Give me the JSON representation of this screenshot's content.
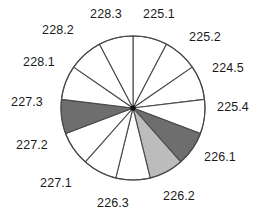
{
  "chart_data": {
    "type": "pie",
    "title": "",
    "subtitle": "",
    "xlabel": "",
    "ylabel": "",
    "legend_position": "none",
    "grid": false,
    "labels_shown": true,
    "start_angle_deg": 0,
    "direction": "clockwise",
    "categories": [
      "225.1",
      "225.2",
      "224.5",
      "225.4",
      "226.1",
      "226.2",
      "226.3",
      "227.1",
      "227.2",
      "227.3",
      "228.1",
      "228.2",
      "228.3"
    ],
    "values": [
      7.7,
      7.7,
      7.7,
      7.7,
      7.7,
      7.7,
      7.7,
      7.7,
      7.7,
      7.7,
      7.7,
      7.7,
      7.7
    ],
    "slices": [
      {
        "label": "225.1",
        "start_deg": 0.0,
        "end_deg": 27.7,
        "fill": "#ffffff",
        "value": 7.7
      },
      {
        "label": "225.2",
        "start_deg": 27.7,
        "end_deg": 55.4,
        "fill": "#ffffff",
        "value": 7.7
      },
      {
        "label": "224.5",
        "start_deg": 55.4,
        "end_deg": 83.1,
        "fill": "#ffffff",
        "value": 7.7
      },
      {
        "label": "225.4",
        "start_deg": 83.1,
        "end_deg": 110.8,
        "fill": "#ffffff",
        "value": 7.7
      },
      {
        "label": "226.1",
        "start_deg": 110.8,
        "end_deg": 138.5,
        "fill": "#6e6e6e",
        "value": 7.7
      },
      {
        "label": "226.2",
        "start_deg": 138.5,
        "end_deg": 166.2,
        "fill": "#bcbcbc",
        "value": 7.7
      },
      {
        "label": "226.3",
        "start_deg": 166.2,
        "end_deg": 193.8,
        "fill": "#ffffff",
        "value": 7.7
      },
      {
        "label": "227.1",
        "start_deg": 193.8,
        "end_deg": 221.5,
        "fill": "#ffffff",
        "value": 7.7
      },
      {
        "label": "227.2",
        "start_deg": 221.5,
        "end_deg": 249.2,
        "fill": "#ffffff",
        "value": 7.7
      },
      {
        "label": "227.3",
        "start_deg": 249.2,
        "end_deg": 276.9,
        "fill": "#6e6e6e",
        "value": 7.7
      },
      {
        "label": "228.1",
        "start_deg": 276.9,
        "end_deg": 304.6,
        "fill": "#ffffff",
        "value": 7.7
      },
      {
        "label": "228.2",
        "start_deg": 304.6,
        "end_deg": 332.3,
        "fill": "#ffffff",
        "value": 7.7
      },
      {
        "label": "228.3",
        "start_deg": 332.3,
        "end_deg": 360.0,
        "fill": "#ffffff",
        "value": 7.7
      }
    ],
    "colors": {
      "slice_white": "#ffffff",
      "slice_dark_gray": "#6e6e6e",
      "slice_light_gray": "#bcbcbc",
      "outline": "#4a4a4a",
      "label_text": "#1a1a1a",
      "background": "#ffffff"
    },
    "geometry": {
      "center_x": 133,
      "center_y": 108,
      "radius": 72,
      "label_radius": 92
    },
    "label_positions": [
      {
        "label": "225.1",
        "x": 159,
        "y": 14
      },
      {
        "label": "225.2",
        "x": 205,
        "y": 37
      },
      {
        "label": "224.5",
        "x": 228,
        "y": 68
      },
      {
        "label": "225.4",
        "x": 233,
        "y": 107
      },
      {
        "label": "226.1",
        "x": 220,
        "y": 157
      },
      {
        "label": "226.2",
        "x": 179,
        "y": 196
      },
      {
        "label": "226.3",
        "x": 113,
        "y": 203
      },
      {
        "label": "227.1",
        "x": 56,
        "y": 183
      },
      {
        "label": "227.2",
        "x": 32,
        "y": 145
      },
      {
        "label": "227.3",
        "x": 27,
        "y": 102
      },
      {
        "label": "228.1",
        "x": 39,
        "y": 62
      },
      {
        "label": "228.2",
        "x": 58,
        "y": 30
      },
      {
        "label": "228.3",
        "x": 106,
        "y": 14
      }
    ]
  }
}
